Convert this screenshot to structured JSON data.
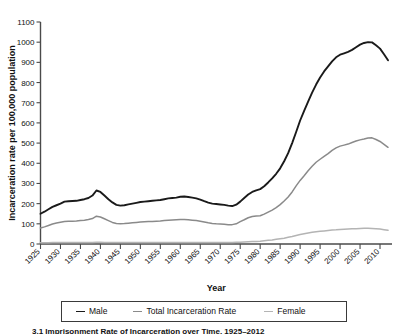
{
  "chart_data": {
    "type": "line",
    "title": "",
    "xlabel": "Year",
    "ylabel": "Incarceration rate per 100,000 population",
    "xlim": [
      1925,
      2013
    ],
    "ylim": [
      0,
      1100
    ],
    "ytick_step": 100,
    "xtick_step": 5,
    "grid": false,
    "legend_position": "bottom",
    "xticks": [
      "1925",
      "1930",
      "1935",
      "1940",
      "1945",
      "1950",
      "1955",
      "1960",
      "1965",
      "1970",
      "1975",
      "1980",
      "1985",
      "1990",
      "1995",
      "2000",
      "2005",
      "2010"
    ],
    "yticks": [
      "0",
      "100",
      "200",
      "300",
      "400",
      "500",
      "600",
      "700",
      "800",
      "900",
      "1000",
      "1100"
    ],
    "x": [
      1925,
      1926,
      1927,
      1928,
      1929,
      1930,
      1931,
      1932,
      1933,
      1934,
      1935,
      1936,
      1937,
      1938,
      1939,
      1940,
      1941,
      1942,
      1943,
      1944,
      1945,
      1946,
      1947,
      1948,
      1949,
      1950,
      1951,
      1952,
      1953,
      1954,
      1955,
      1956,
      1957,
      1958,
      1959,
      1960,
      1961,
      1962,
      1963,
      1964,
      1965,
      1966,
      1967,
      1968,
      1969,
      1970,
      1971,
      1972,
      1973,
      1974,
      1975,
      1976,
      1977,
      1978,
      1979,
      1980,
      1981,
      1982,
      1983,
      1984,
      1985,
      1986,
      1987,
      1988,
      1989,
      1990,
      1991,
      1992,
      1993,
      1994,
      1995,
      1996,
      1997,
      1998,
      1999,
      2000,
      2001,
      2002,
      2003,
      2004,
      2005,
      2006,
      2007,
      2008,
      2009,
      2010,
      2011,
      2012
    ],
    "series": [
      {
        "name": "Male",
        "color": "#1a1a1a",
        "values": [
          150,
          160,
          172,
          184,
          192,
          200,
          210,
          212,
          213,
          214,
          218,
          222,
          228,
          240,
          265,
          258,
          240,
          222,
          206,
          194,
          190,
          192,
          196,
          200,
          204,
          208,
          210,
          212,
          214,
          216,
          218,
          222,
          226,
          228,
          230,
          234,
          235,
          233,
          230,
          226,
          220,
          212,
          205,
          200,
          198,
          196,
          194,
          190,
          188,
          195,
          210,
          228,
          245,
          258,
          266,
          272,
          286,
          305,
          325,
          348,
          375,
          410,
          450,
          500,
          555,
          612,
          660,
          705,
          750,
          790,
          825,
          855,
          880,
          905,
          925,
          938,
          945,
          952,
          962,
          975,
          988,
          996,
          1000,
          999,
          985,
          968,
          940,
          910
        ]
      },
      {
        "name": "Total Incarceration Rate",
        "color": "#8a8a8a",
        "values": [
          79,
          85,
          92,
          99,
          104,
          108,
          112,
          113,
          113,
          114,
          116,
          118,
          121,
          126,
          138,
          134,
          125,
          116,
          107,
          102,
          100,
          101,
          103,
          105,
          107,
          109,
          110,
          111,
          112,
          113,
          114,
          116,
          118,
          119,
          120,
          121,
          121,
          120,
          118,
          116,
          113,
          109,
          105,
          102,
          100,
          99,
          98,
          96,
          96,
          100,
          111,
          120,
          130,
          136,
          139,
          140,
          148,
          158,
          168,
          180,
          195,
          213,
          233,
          258,
          288,
          315,
          338,
          363,
          385,
          405,
          420,
          434,
          448,
          464,
          476,
          485,
          490,
          495,
          503,
          510,
          516,
          520,
          525,
          526,
          518,
          508,
          494,
          479
        ]
      },
      {
        "name": "Female",
        "color": "#b4b4b4",
        "values": [
          6,
          6,
          6,
          7,
          7,
          7,
          7,
          7,
          7,
          7,
          7,
          8,
          8,
          8,
          9,
          9,
          8,
          8,
          7,
          7,
          7,
          7,
          7,
          7,
          7,
          7,
          8,
          8,
          8,
          8,
          8,
          8,
          8,
          8,
          8,
          8,
          8,
          8,
          8,
          8,
          8,
          8,
          8,
          8,
          8,
          8,
          8,
          8,
          8,
          9,
          9,
          10,
          11,
          12,
          13,
          14,
          16,
          18,
          20,
          23,
          26,
          29,
          33,
          37,
          42,
          47,
          51,
          55,
          58,
          61,
          63,
          65,
          67,
          69,
          70,
          72,
          73,
          74,
          75,
          76,
          77,
          78,
          78,
          77,
          76,
          74,
          71,
          68
        ]
      }
    ]
  },
  "legend": {
    "items": [
      {
        "label": "Male",
        "color": "#1a1a1a"
      },
      {
        "label": "Total Incarceration Rate",
        "color": "#8a8a8a"
      },
      {
        "label": "Female",
        "color": "#b4b4b4"
      }
    ]
  },
  "caption": {
    "text": "3.1  Imprisonment Rate of Incarceration over Time, 1925–2012"
  }
}
